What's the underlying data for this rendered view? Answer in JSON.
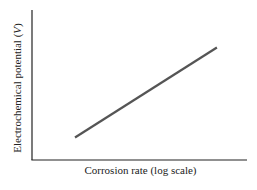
{
  "chart_data": {
    "type": "line",
    "title": "",
    "xlabel": "Corrosion rate (log scale)",
    "ylabel": "Electrochemical potential (V)",
    "x_ticks": [],
    "y_ticks": [],
    "grid": false,
    "legend": null,
    "series": [
      {
        "name": "potential vs corrosion rate",
        "x": [
          0.2,
          0.86
        ],
        "y": [
          0.15,
          0.75
        ]
      }
    ],
    "xlim": [
      0,
      1
    ],
    "ylim": [
      0,
      1
    ],
    "colors": {
      "line": "#555555",
      "axes": "#222222"
    }
  },
  "labels": {
    "x": "Corrosion rate (log scale)",
    "y_prefix": "Electrochemical potential (",
    "y_var": "V",
    "y_suffix": ")"
  }
}
